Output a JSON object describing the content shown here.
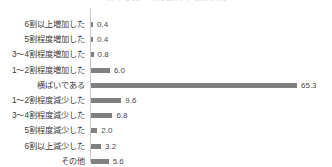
{
  "clipped_header": {
    "text": "前年と比べた売上高の増減状況"
  },
  "chart_data": {
    "type": "bar",
    "orientation": "horizontal",
    "title": "",
    "subtitle": "",
    "xlabel": "",
    "ylabel": "",
    "xlim": [
      0,
      66
    ],
    "grid": false,
    "legend": false,
    "value_suffix": "",
    "bar_color": "#808080",
    "axis_color": "#c9c9c9",
    "categories": [
      "6割以上増加した",
      "5割程度増加した",
      "3〜4割程度増加した",
      "1〜2割程度増加した",
      "横ばいである",
      "1〜2割程度減少した",
      "3〜4割程度減少した",
      "5割程度減少した",
      "6割以上減少した",
      "その他"
    ],
    "values": [
      0.4,
      0.4,
      0.8,
      6.0,
      65.3,
      9.6,
      6.8,
      2.0,
      3.2,
      5.6
    ],
    "value_labels": [
      "0.4",
      "0.4",
      "0.8",
      "6.0",
      "65.3",
      "9.6",
      "6.8",
      "2.0",
      "3.2",
      "5.6"
    ]
  }
}
